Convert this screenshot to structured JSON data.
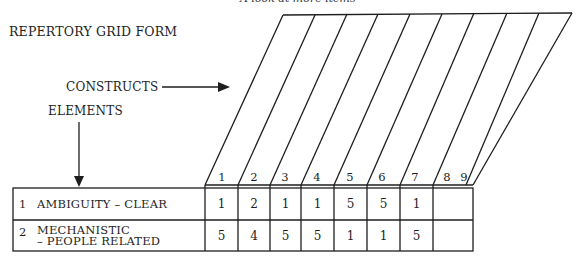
{
  "header": {
    "top_caption_cut": "A look at more items",
    "title": "REPERTORY GRID FORM"
  },
  "labels": {
    "constructs": "CONSTRUCTS",
    "elements": "ELEMENTS"
  },
  "grid": {
    "column_numbers": [
      "1",
      "2",
      "3",
      "4",
      "5",
      "6",
      "7",
      "8",
      "9"
    ],
    "rows": [
      {
        "num": "1",
        "label_line1": "AMBIGUITY – CLEAR",
        "label_line2": "",
        "values": [
          "1",
          "2",
          "1",
          "1",
          "5",
          "5",
          "1",
          "1",
          "5"
        ]
      },
      {
        "num": "2",
        "label_line1": "MECHANISTIC",
        "label_line2": "– PEOPLE RELATED",
        "values": [
          "5",
          "4",
          "5",
          "5",
          "1",
          "1",
          "5",
          "5",
          "1"
        ]
      }
    ]
  },
  "colors": {
    "ink": "#1e1e1e",
    "background": "#ffffff"
  }
}
